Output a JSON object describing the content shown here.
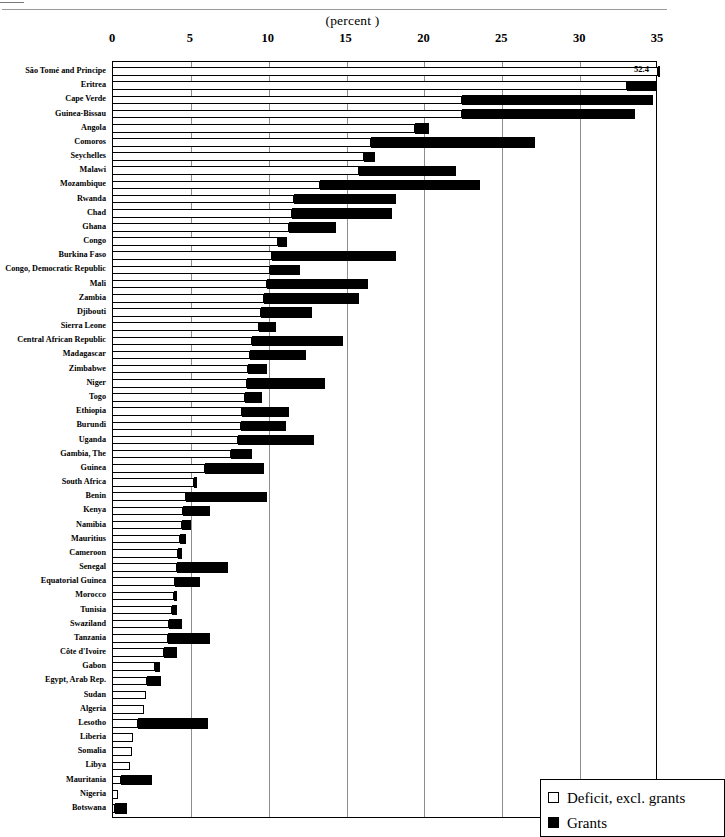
{
  "axis_title": "(percent )",
  "legend": {
    "deficit_label": "Deficit, excl. grants",
    "grants_label": "Grants",
    "deficit_color": "#ffffff",
    "grants_color": "#000000"
  },
  "annotations": [
    {
      "text": "52.4",
      "country": "São Tomé and Principe"
    }
  ],
  "chart_data": {
    "type": "bar",
    "orientation": "horizontal",
    "stacked": true,
    "title": "",
    "subtitle": "",
    "xlabel": "(percent )",
    "ylabel": "",
    "xlim": [
      0,
      35
    ],
    "xticks": [
      0,
      5,
      10,
      15,
      20,
      25,
      30,
      35
    ],
    "xtick_labels": [
      "0",
      "5",
      "10",
      "15",
      "20",
      "25",
      "30",
      "35"
    ],
    "grid": true,
    "legend_position": "bottom-right",
    "categories": [
      "São Tomé and Principe",
      "Eritrea",
      "Cape Verde",
      "Guinea-Bissau",
      "Angola",
      "Comoros",
      "Seychelles",
      "Malawi",
      "Mozambique",
      "Rwanda",
      "Chad",
      "Ghana",
      "Congo",
      "Burkina Faso",
      "Congo, Democratic  Republic",
      "Mali",
      "Zambia",
      "Djibouti",
      "Sierra Leone",
      "Central African Republic",
      "Madagascar",
      "Zimbabwe",
      "Niger",
      "Togo",
      "Ethiopia",
      "Burundi",
      "Uganda",
      "Gambia, The",
      "Guinea",
      "South Africa",
      "Benin",
      "Kenya",
      "Namibia",
      "Mauritius",
      "Cameroon",
      "Senegal",
      "Equatorial Guinea",
      "Morocco",
      "Tunisia",
      "Swaziland",
      "Tanzania",
      "Côte d'Ivoire",
      "Gabon",
      "Egypt,  Arab Rep.",
      "Sudan",
      "Algeria",
      "Lesotho",
      "Liberia",
      "Somalia",
      "Libya",
      "Mauritania",
      "Nigeria",
      "Botswana"
    ],
    "series": [
      {
        "name": "Deficit, excl. grants",
        "color": "#ffffff",
        "values": [
          35.0,
          33.0,
          22.4,
          22.4,
          19.4,
          16.6,
          16.1,
          15.8,
          13.3,
          11.6,
          11.5,
          11.3,
          10.6,
          10.2,
          10.1,
          9.9,
          9.7,
          9.5,
          9.4,
          8.9,
          8.8,
          8.7,
          8.6,
          8.5,
          8.3,
          8.2,
          8.0,
          7.6,
          5.9,
          5.2,
          4.7,
          4.5,
          4.4,
          4.3,
          4.2,
          4.1,
          4.0,
          3.9,
          3.8,
          3.6,
          3.5,
          3.3,
          2.7,
          2.2,
          2.1,
          2.0,
          1.6,
          1.3,
          1.2,
          1.1,
          0.5,
          0.3,
          0.1
        ]
      },
      {
        "name": "Grants",
        "color": "#000000",
        "values": [
          17.4,
          1.9,
          12.3,
          11.1,
          0.9,
          10.5,
          0.7,
          6.2,
          10.3,
          6.6,
          6.4,
          3.0,
          0.6,
          8.0,
          1.9,
          6.5,
          6.1,
          3.3,
          1.1,
          5.9,
          3.6,
          1.2,
          5.0,
          1.1,
          3.0,
          2.9,
          4.9,
          1.3,
          3.8,
          0.2,
          5.2,
          1.7,
          0.6,
          0.4,
          0.2,
          3.3,
          1.6,
          0.2,
          0.3,
          0.8,
          2.7,
          0.8,
          0.3,
          0.9,
          0.0,
          0.0,
          4.5,
          0.0,
          0.0,
          0.0,
          2.0,
          0.0,
          0.8
        ]
      }
    ]
  }
}
